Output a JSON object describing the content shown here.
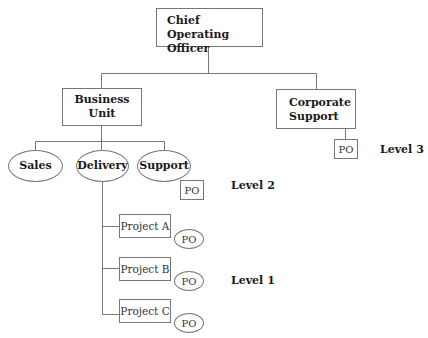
{
  "diagram": {
    "type": "org-chart",
    "root": {
      "label": "Chief Operating Officer",
      "line1": "Chief Operating",
      "line2": "Officer"
    },
    "business_unit": {
      "label": "Business Unit",
      "children": [
        {
          "label": "Sales"
        },
        {
          "label": "Delivery"
        },
        {
          "label": "Support"
        }
      ],
      "support_po": "PO"
    },
    "corporate_support": {
      "line1": "Corporate",
      "line2": "Support",
      "po": "PO"
    },
    "projects": [
      {
        "label": "Project A",
        "po": "PO"
      },
      {
        "label": "Project B",
        "po": "PO"
      },
      {
        "label": "Project C",
        "po": "PO"
      }
    ],
    "levels": {
      "level3": "Level 3",
      "level2": "Level 2",
      "level1": "Level 1"
    }
  },
  "colors": {
    "line": "#777777",
    "background": "#ffffff",
    "text": "#1a1a1a"
  }
}
